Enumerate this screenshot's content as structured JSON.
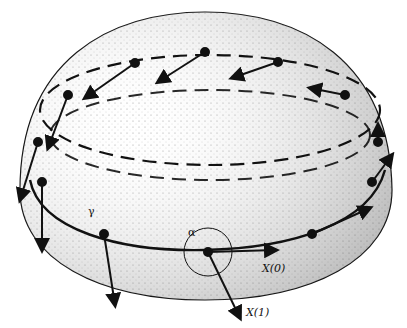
{
  "figure": {
    "labels": {
      "gamma": "γ",
      "alpha": "α",
      "x0": "X(0)",
      "x1": "X(1)"
    }
  }
}
